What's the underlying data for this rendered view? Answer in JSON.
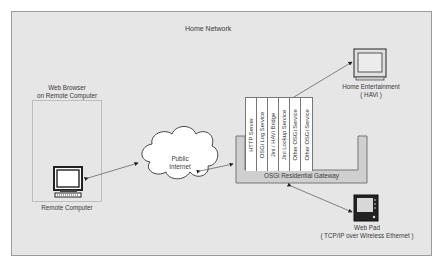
{
  "title": "Home Network",
  "remote": {
    "group_label_line1": "Web Browser",
    "group_label_line2": "on Remote Computer",
    "device_label": "Remote Computer"
  },
  "internet": {
    "line1": "Public",
    "line2": "Internet"
  },
  "gateway": {
    "label": "OSGi Residential Gateway",
    "services": [
      "HTTP Server",
      "OSGi Log Service",
      "Jini / HAVi Bridge",
      "Jini Lookup Service",
      "Other OSGi Service",
      "Other OSGi Service"
    ]
  },
  "entertainment": {
    "line1": "Home Entertainment",
    "line2": "( HAVi )"
  },
  "webpad": {
    "line1": "Web Pad",
    "line2": "( TCP/IP over Wireless Ethernet )"
  },
  "colors": {
    "background": "#e6e6e6",
    "gateway": "#cfcfcf",
    "line": "#555555"
  }
}
